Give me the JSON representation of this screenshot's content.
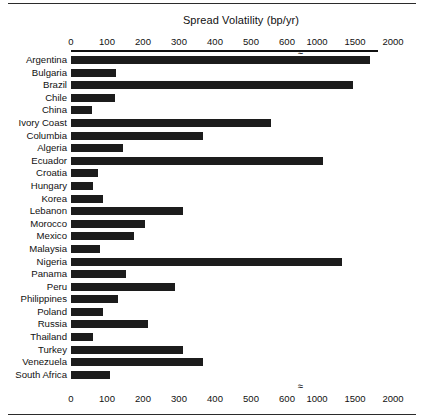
{
  "chart_data": {
    "type": "bar",
    "orientation": "horizontal",
    "title": "Spread Volatility (bp/yr)",
    "xlabel": "Spread Volatility (bp/yr)",
    "ylabel": "",
    "grid": false,
    "legend": null,
    "axis_break": {
      "symbol": "≈",
      "between": [
        600,
        1000
      ],
      "note": "x-axis is broken between 600 and 1000"
    },
    "tick_labels": [
      "0",
      "100",
      "200",
      "300",
      "400",
      "500",
      "600",
      "1000",
      "1500",
      "2000"
    ],
    "tick_values": [
      0,
      100,
      200,
      300,
      400,
      500,
      600,
      1000,
      1500,
      2000
    ],
    "xlim": [
      0,
      2000
    ],
    "categories": [
      "Argentina",
      "Bulgaria",
      "Brazil",
      "Chile",
      "China",
      "Ivory Coast",
      "Columbia",
      "Algeria",
      "Ecuador",
      "Croatia",
      "Hungary",
      "Korea",
      "Lebanon",
      "Morocco",
      "Mexico",
      "Malaysia",
      "Nigeria",
      "Panama",
      "Peru",
      "Philippines",
      "Poland",
      "Russia",
      "Thailand",
      "Turkey",
      "Venezuela",
      "South Africa"
    ],
    "values": [
      1700,
      125,
      1470,
      122,
      58,
      555,
      367,
      145,
      1080,
      75,
      62,
      90,
      310,
      205,
      175,
      80,
      1330,
      153,
      289,
      131,
      88,
      215,
      62,
      311,
      367,
      107
    ],
    "bars": [
      {
        "label": "Argentina",
        "value": 1700
      },
      {
        "label": "Bulgaria",
        "value": 125
      },
      {
        "label": "Brazil",
        "value": 1470
      },
      {
        "label": "Chile",
        "value": 122
      },
      {
        "label": "China",
        "value": 58
      },
      {
        "label": "Ivory Coast",
        "value": 555
      },
      {
        "label": "Columbia",
        "value": 367
      },
      {
        "label": "Algeria",
        "value": 145
      },
      {
        "label": "Ecuador",
        "value": 1080
      },
      {
        "label": "Croatia",
        "value": 75
      },
      {
        "label": "Hungary",
        "value": 62
      },
      {
        "label": "Korea",
        "value": 90
      },
      {
        "label": "Lebanon",
        "value": 310
      },
      {
        "label": "Morocco",
        "value": 205
      },
      {
        "label": "Mexico",
        "value": 175
      },
      {
        "label": "Malaysia",
        "value": 80
      },
      {
        "label": "Nigeria",
        "value": 1330
      },
      {
        "label": "Panama",
        "value": 153
      },
      {
        "label": "Peru",
        "value": 289
      },
      {
        "label": "Philippines",
        "value": 131
      },
      {
        "label": "Poland",
        "value": 88
      },
      {
        "label": "Russia",
        "value": 215
      },
      {
        "label": "Thailand",
        "value": 62
      },
      {
        "label": "Turkey",
        "value": 311
      },
      {
        "label": "Venezuela",
        "value": 367
      },
      {
        "label": "South Africa",
        "value": 107
      }
    ],
    "colors": {
      "bar": "#1c1c1c",
      "axis": "#111111",
      "text": "#111111",
      "background": "#ffffff"
    }
  }
}
